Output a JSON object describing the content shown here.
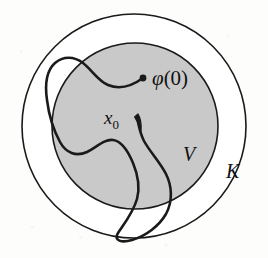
{
  "figure": {
    "background_color": "#fdfdfc",
    "stroke_color": "#1a1a1a",
    "outer_region": {
      "name": "K",
      "label": "K",
      "shape": "circle",
      "fill": "#ffffff",
      "center": [
        134,
        126
      ],
      "radius": 112,
      "stroke_width": 1.6
    },
    "inner_region": {
      "name": "V",
      "label": "V",
      "shape": "circle",
      "fill": "#c9c9c9",
      "center": [
        135,
        126
      ],
      "radius": 83,
      "stroke_width": 1.6
    },
    "curve": {
      "name": "phi",
      "stroke_width": 2.6,
      "description": "continuous path starting at phi(0), looping left outside V, through x0, down into a bottom loop outside V"
    },
    "markers": [
      {
        "name": "phi-zero-endpoint",
        "label": "φ(0)",
        "type": "dot",
        "position": [
          143,
          78
        ],
        "radius": 3.4
      },
      {
        "name": "x0-arrowhead",
        "label": "x",
        "sub": "0",
        "type": "arrowhead",
        "position": [
          138,
          122
        ]
      }
    ],
    "labels": {
      "phi_zero": "φ(0)",
      "phi_zero_symbol": "φ",
      "phi_zero_paren": "(0)",
      "x_zero": "x",
      "x_zero_sub": "0",
      "V": "V",
      "K": "K"
    }
  }
}
